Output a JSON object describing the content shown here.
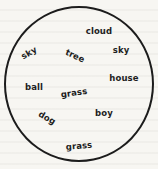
{
  "worksheet": {
    "words": [
      {
        "id": "cloud",
        "text": "cloud",
        "x": 99,
        "y": 31,
        "rotate": 0
      },
      {
        "id": "sky-left",
        "text": "sky",
        "x": 29,
        "y": 53,
        "rotate": -30
      },
      {
        "id": "tree",
        "text": "tree",
        "x": 75,
        "y": 56,
        "rotate": 25
      },
      {
        "id": "sky-right",
        "text": "sky",
        "x": 121,
        "y": 50,
        "rotate": 0
      },
      {
        "id": "house",
        "text": "house",
        "x": 124,
        "y": 78,
        "rotate": 0
      },
      {
        "id": "ball",
        "text": "ball",
        "x": 34,
        "y": 87,
        "rotate": 0
      },
      {
        "id": "grass-middle",
        "text": "grass",
        "x": 74,
        "y": 93,
        "rotate": -8
      },
      {
        "id": "boy",
        "text": "boy",
        "x": 104,
        "y": 113,
        "rotate": 0
      },
      {
        "id": "dog",
        "text": "dog",
        "x": 47,
        "y": 118,
        "rotate": 30
      },
      {
        "id": "grass-bottom",
        "text": "grass",
        "x": 79,
        "y": 146,
        "rotate": -5
      }
    ]
  },
  "colors": {
    "ink": "#1e1e1e",
    "paper": "#f7f6f2"
  }
}
